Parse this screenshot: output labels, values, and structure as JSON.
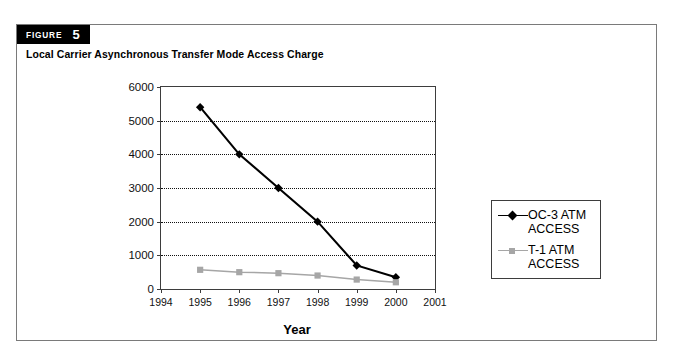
{
  "figure": {
    "badge_word": "FIGURE",
    "badge_number": "5",
    "title": "Local Carrier Asynchronous Transfer Mode Access Charge"
  },
  "chart_data": {
    "type": "line",
    "title": "Local Carrier Asynchronous Transfer Mode Access Charge",
    "xlabel": "Year",
    "ylabel": "",
    "x": [
      1994,
      1995,
      1996,
      1997,
      1998,
      1999,
      2000,
      2001
    ],
    "xtick_labels": [
      "1994",
      "1995",
      "1996",
      "1997",
      "1998",
      "1999",
      "2000",
      "2001"
    ],
    "ytick_labels": [
      "0",
      "1000",
      "2000",
      "3000",
      "4000",
      "5000",
      "6000"
    ],
    "yticks": [
      0,
      1000,
      2000,
      3000,
      4000,
      5000,
      6000
    ],
    "xlim": [
      1994,
      2001
    ],
    "ylim": [
      0,
      6000
    ],
    "grid": "horizontal-dotted",
    "legend_position": "right-outside",
    "series": [
      {
        "name": "OC-3 ATM\nACCESS",
        "color": "#000000",
        "marker": "diamond",
        "x": [
          1995,
          1996,
          1997,
          1998,
          1999,
          2000
        ],
        "values": [
          5400,
          4000,
          3000,
          2000,
          700,
          350
        ]
      },
      {
        "name": "T-1 ATM\nACCESS",
        "color": "#a6a6a6",
        "marker": "square",
        "x": [
          1995,
          1996,
          1997,
          1998,
          1999,
          2000
        ],
        "values": [
          570,
          500,
          470,
          400,
          280,
          200
        ]
      }
    ]
  }
}
